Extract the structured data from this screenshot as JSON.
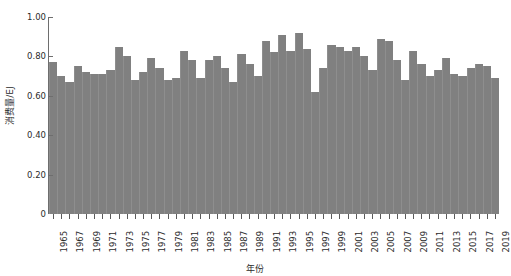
{
  "chart_data": {
    "type": "bar",
    "title": "",
    "xlabel": "年份",
    "ylabel": "消费量/EJ",
    "ylim": [
      0,
      1.0
    ],
    "xlim": [
      1965,
      2019
    ],
    "grid": false,
    "legend": "none",
    "series_color": "#808080",
    "ytick_labels": [
      "0",
      "0.20",
      "0.40",
      "0.60",
      "0.80",
      "1.00"
    ],
    "ytick_values": [
      0,
      0.2,
      0.4,
      0.6,
      0.8,
      1.0
    ],
    "xtick_labels": [
      "1965",
      "1967",
      "1969",
      "1971",
      "1973",
      "1975",
      "1977",
      "1979",
      "1981",
      "1983",
      "1985",
      "1987",
      "1989",
      "1991",
      "1993",
      "1995",
      "1997",
      "1999",
      "2001",
      "2003",
      "2005",
      "2007",
      "2009",
      "2011",
      "2013",
      "2015",
      "2017",
      "2019"
    ],
    "categories": [
      1965,
      1966,
      1967,
      1968,
      1969,
      1970,
      1971,
      1972,
      1973,
      1974,
      1975,
      1976,
      1977,
      1978,
      1979,
      1980,
      1981,
      1982,
      1983,
      1984,
      1985,
      1986,
      1987,
      1988,
      1989,
      1990,
      1991,
      1992,
      1993,
      1994,
      1995,
      1996,
      1997,
      1998,
      1999,
      2000,
      2001,
      2002,
      2003,
      2004,
      2005,
      2006,
      2007,
      2008,
      2009,
      2010,
      2011,
      2012,
      2013,
      2014,
      2015,
      2016,
      2017,
      2018,
      2019
    ],
    "values": [
      0.77,
      0.7,
      0.67,
      0.75,
      0.72,
      0.71,
      0.71,
      0.73,
      0.85,
      0.8,
      0.68,
      0.72,
      0.79,
      0.74,
      0.68,
      0.69,
      0.83,
      0.78,
      0.69,
      0.78,
      0.8,
      0.74,
      0.67,
      0.81,
      0.76,
      0.7,
      0.88,
      0.82,
      0.91,
      0.83,
      0.92,
      0.84,
      0.62,
      0.74,
      0.86,
      0.85,
      0.83,
      0.85,
      0.8,
      0.73,
      0.89,
      0.88,
      0.78,
      0.68,
      0.83,
      0.76,
      0.7,
      0.73,
      0.79,
      0.71,
      0.7,
      0.74,
      0.76,
      0.75,
      0.69
    ]
  }
}
